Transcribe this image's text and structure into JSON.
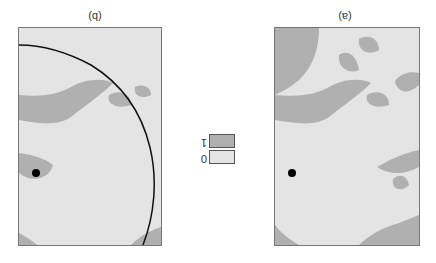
{
  "figure": {
    "orientation": "rotated-180",
    "panels": [
      {
        "id": "a",
        "label": "(a)",
        "has_circle": false
      },
      {
        "id": "b",
        "label": "(b)",
        "has_circle": true
      }
    ],
    "legend": {
      "items": [
        {
          "value": "1",
          "color": "#b0b0b0"
        },
        {
          "value": "0",
          "color": "#e4e4e4"
        }
      ]
    },
    "colors": {
      "land": "#b0b0b0",
      "background": "#e4e4e4",
      "circle": "#111111",
      "point": "#000000"
    }
  }
}
